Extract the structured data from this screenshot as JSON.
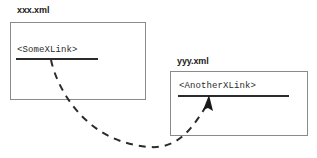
{
  "diagram": {
    "background_color": "#ffffff",
    "line_color": "#2b2b2b",
    "box_border_color": "#8a8a8a",
    "documents": [
      {
        "id": "xxx",
        "label": "xxx.xml",
        "element_name": "<SomeXLink>"
      },
      {
        "id": "yyy",
        "label": "yyy.xml",
        "element_name": "<AnotherXLink>"
      }
    ],
    "connector": {
      "style": "dashed",
      "direction": "xxx.xml to yyy.xml",
      "arrowhead": "arrow-head-icon",
      "dash_pattern": "7 6",
      "stroke_width": 2
    }
  }
}
